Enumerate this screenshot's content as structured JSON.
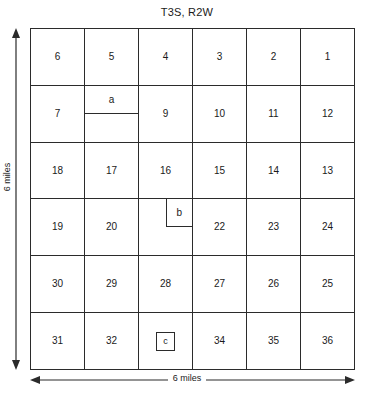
{
  "title": "T3S, R2W",
  "grid": {
    "columns": 6,
    "rows": 6,
    "cells": [
      {
        "label": "6",
        "sub": null
      },
      {
        "label": "5",
        "sub": null
      },
      {
        "label": "4",
        "sub": null
      },
      {
        "label": "3",
        "sub": null
      },
      {
        "label": "2",
        "sub": null
      },
      {
        "label": "1",
        "sub": null
      },
      {
        "label": "7",
        "sub": null
      },
      {
        "label": "",
        "sub": {
          "kind": "half",
          "label": "a"
        }
      },
      {
        "label": "9",
        "sub": null
      },
      {
        "label": "10",
        "sub": null
      },
      {
        "label": "11",
        "sub": null
      },
      {
        "label": "12",
        "sub": null
      },
      {
        "label": "18",
        "sub": null
      },
      {
        "label": "17",
        "sub": null
      },
      {
        "label": "16",
        "sub": null
      },
      {
        "label": "15",
        "sub": null
      },
      {
        "label": "14",
        "sub": null
      },
      {
        "label": "13",
        "sub": null
      },
      {
        "label": "19",
        "sub": null
      },
      {
        "label": "20",
        "sub": null
      },
      {
        "label": "",
        "sub": {
          "kind": "quarter",
          "label": "b"
        }
      },
      {
        "label": "22",
        "sub": null
      },
      {
        "label": "23",
        "sub": null
      },
      {
        "label": "24",
        "sub": null
      },
      {
        "label": "30",
        "sub": null
      },
      {
        "label": "29",
        "sub": null
      },
      {
        "label": "28",
        "sub": null
      },
      {
        "label": "27",
        "sub": null
      },
      {
        "label": "26",
        "sub": null
      },
      {
        "label": "25",
        "sub": null
      },
      {
        "label": "31",
        "sub": null
      },
      {
        "label": "32",
        "sub": null
      },
      {
        "label": "",
        "sub": {
          "kind": "box",
          "label": "c"
        }
      },
      {
        "label": "34",
        "sub": null
      },
      {
        "label": "35",
        "sub": null
      },
      {
        "label": "36",
        "sub": null
      }
    ]
  },
  "dimensions": {
    "vertical_label": "6 miles",
    "horizontal_label": "6 miles"
  },
  "colors": {
    "line": "#2b2b2b",
    "text": "#1a1a1a",
    "background": "#ffffff"
  }
}
